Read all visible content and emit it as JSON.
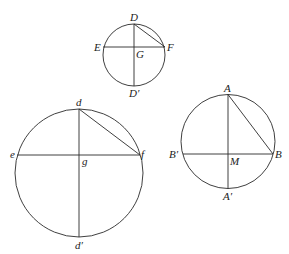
{
  "figure": {
    "stroke_color": "#2a2a2a",
    "label_color": "#222222",
    "background": "#ffffff",
    "circles": [
      {
        "id": "small-top",
        "center": [
          134,
          55
        ],
        "radius": 31,
        "center_label": "G",
        "labels": {
          "top": "D",
          "bottom": "D′",
          "left": "E",
          "right": "F",
          "center": "G"
        },
        "chord_y": 47,
        "chord_x_left": 103,
        "chord_x_right": 165
      },
      {
        "id": "large-left",
        "center": [
          79,
          173
        ],
        "radius": 64,
        "labels": {
          "top": "d",
          "bottom": "d′",
          "left": "e",
          "right": "f",
          "center": "g"
        },
        "chord_y": 155,
        "chord_x_left": 17,
        "chord_x_right": 140
      },
      {
        "id": "medium-right",
        "center": [
          228,
          141.5
        ],
        "radius": 47,
        "labels": {
          "top": "A",
          "bottom": "A′",
          "left": "B′",
          "right": "B",
          "center": "M"
        },
        "chord_y": 154,
        "chord_x_left": 183,
        "chord_x_right": 273
      }
    ]
  }
}
